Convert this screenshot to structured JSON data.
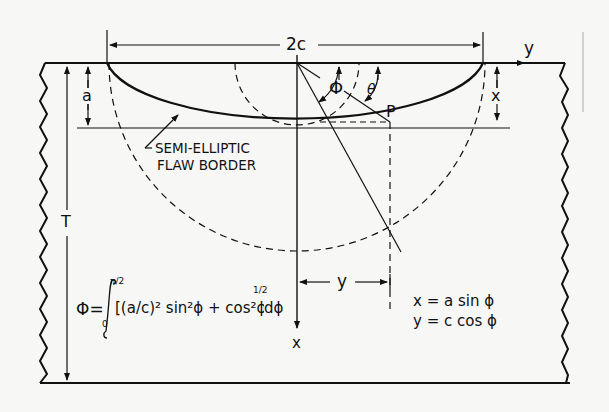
{
  "diagram": {
    "labels": {
      "width_dimension": "2c",
      "depth_dimension": "a",
      "thickness_dimension": "T",
      "y_axis": "y",
      "x_axis": "x",
      "x_depth_marker": "x",
      "y_offset_marker": "y",
      "point": "P",
      "angle_phi": "Φ",
      "angle_theta": "θ",
      "flaw_border_line1": "SEMI-ELLIPTIC",
      "flaw_border_line2": "FLAW BORDER"
    },
    "equations": {
      "phi_integral_lhs": "Φ=",
      "phi_integral_upper": "π/2",
      "phi_integral_lower": "0",
      "phi_integral_body": "[(a/c)² sin²ϕ + cos²ϕ]",
      "phi_integral_power": "1/2",
      "phi_integral_tail": "dϕ",
      "phi_integral_full": "Φ = ∫₀^{π/2} [(a/c)² sin²ϕ + cos²ϕ]^{1/2} dϕ",
      "param_x": "x = a sin ϕ",
      "param_y": "y = c cos ϕ"
    },
    "colors": {
      "ink": "#111111",
      "paper": "#f7f7f5"
    }
  }
}
